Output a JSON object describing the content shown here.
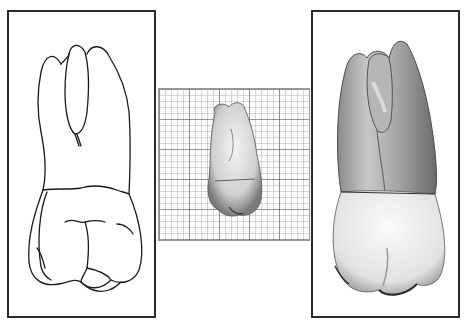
{
  "figure": {
    "panels": [
      {
        "id": "left",
        "label": "line-drawing",
        "description": "Line drawing of a maxillary molar, three roots, crown below"
      },
      {
        "id": "center",
        "label": "photo-on-grid",
        "description": "Small photograph of tooth on graph paper for scale"
      },
      {
        "id": "right",
        "label": "enlarged-photo",
        "description": "Enlarged grayscale photograph of the same tooth"
      }
    ],
    "colors": {
      "frame": "#2a2a2a",
      "grid_major": "#5a5a5a",
      "grid_minor": "#969696",
      "background": "#ffffff"
    }
  }
}
